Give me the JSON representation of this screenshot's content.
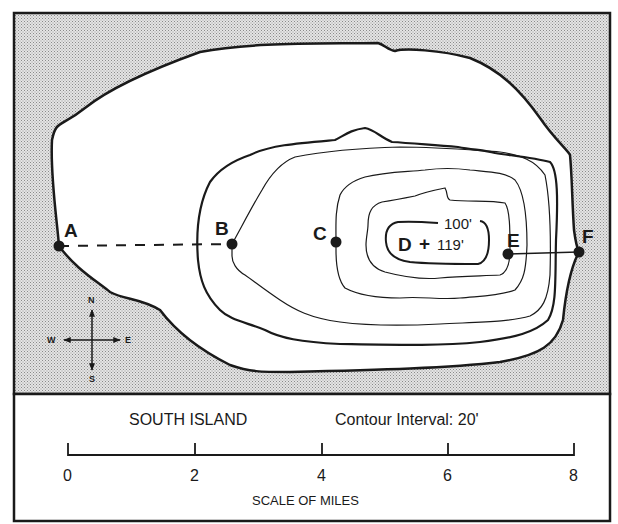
{
  "map": {
    "island_name": "SOUTH ISLAND",
    "contour_interval": "Contour Interval: 20'",
    "points": [
      {
        "id": "A",
        "label": "A",
        "x": 59,
        "y": 246
      },
      {
        "id": "B",
        "label": "B",
        "x": 232,
        "y": 244
      },
      {
        "id": "C",
        "label": "C",
        "x": 336,
        "y": 242
      },
      {
        "id": "D",
        "label": "D",
        "x": 420,
        "y": 243
      },
      {
        "id": "E",
        "label": "E",
        "x": 508,
        "y": 254
      },
      {
        "id": "F",
        "label": "F",
        "x": 579,
        "y": 252
      }
    ],
    "summit_marker": "+",
    "elevation_labels": {
      "top_contour": "100'",
      "summit": "119'"
    },
    "profile_lines": [
      {
        "from": "A",
        "to": "B",
        "style": "dashed"
      },
      {
        "from": "E",
        "to": "F",
        "style": "solid"
      }
    ],
    "compass": {
      "north": "N",
      "south": "S",
      "east": "E",
      "west": "W"
    },
    "colors": {
      "water": "#c9c9c9",
      "land": "#ffffff",
      "line": "#1a1a1a"
    }
  },
  "scale_bar": {
    "ticks": [
      "0",
      "2",
      "4",
      "6",
      "8"
    ],
    "title": "SCALE OF MILES",
    "unit": "miles"
  }
}
